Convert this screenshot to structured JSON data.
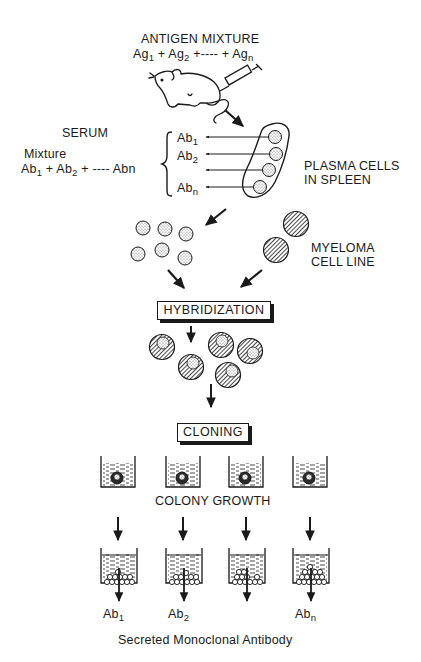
{
  "antigen": {
    "heading": "ANTIGEN MIXTURE",
    "formula": [
      {
        "base": "Ag",
        "sub": "1"
      },
      {
        "sep": " + "
      },
      {
        "base": "Ag",
        "sub": "2"
      },
      {
        "sep": " +---- + "
      },
      {
        "base": "Ag",
        "sub": "n"
      }
    ]
  },
  "serum": {
    "heading": "SERUM",
    "mixture_label": "Mixture",
    "formula": [
      {
        "base": "Ab",
        "sub": "1"
      },
      {
        "sep": " + "
      },
      {
        "base": "Ab",
        "sub": "2"
      },
      {
        "sep": " + ---- Abn"
      }
    ],
    "antibodies": [
      {
        "base": "Ab",
        "sub": "1"
      },
      {
        "base": "Ab",
        "sub": "2"
      },
      {
        "base": "",
        "sub": ""
      },
      {
        "base": "Ab",
        "sub": "n"
      }
    ]
  },
  "spleen": {
    "label_line1": "PLASMA CELLS",
    "label_line2": "IN SPLEEN",
    "cell_count": 4
  },
  "myeloma": {
    "label_line1": "MYELOMA",
    "label_line2": "CELL LINE",
    "cell_count": 2
  },
  "plasma_cells_free_count": 6,
  "hybridization_label": "HYBRIDIZATION",
  "hybrid_cell_count": 5,
  "cloning_label": "CLONING",
  "colony_growth_label": "COLONY GROWTH",
  "wells": [
    {
      "output": {
        "base": "Ab",
        "sub": "1"
      }
    },
    {
      "output": {
        "base": "Ab",
        "sub": "2"
      }
    },
    {
      "output": {
        "base": "",
        "sub": ""
      }
    },
    {
      "output": {
        "base": "Ab",
        "sub": "n"
      }
    }
  ],
  "footer": "Secreted Monoclonal Antibody",
  "colors": {
    "ink": "#1a1a1a",
    "paper": "#ffffff"
  }
}
